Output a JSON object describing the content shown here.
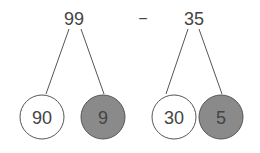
{
  "operator": "−",
  "left": {
    "value": "99",
    "parts": [
      {
        "value": "90",
        "shaded": false
      },
      {
        "value": "9",
        "shaded": true
      }
    ]
  },
  "right": {
    "value": "35",
    "parts": [
      {
        "value": "30",
        "shaded": false
      },
      {
        "value": "5",
        "shaded": true
      }
    ]
  },
  "colors": {
    "line": "#555555",
    "text": "#444444",
    "shaded_fill": "#8a8a8a",
    "plain_fill": "#ffffff"
  }
}
